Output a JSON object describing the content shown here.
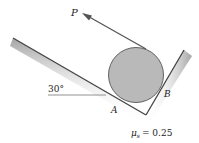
{
  "diagram": {
    "force_label": "P",
    "angle_label": "30°",
    "contact_a_label": "A",
    "contact_b_label": "B",
    "friction_symbol": "μ",
    "friction_subscript": "s",
    "friction_value": "= 0.25"
  },
  "colors": {
    "cylinder_fill": "#b9b9b9",
    "cylinder_stroke": "#555555",
    "surface_line": "#444444",
    "arrow": "#555555",
    "text": "#222222"
  }
}
